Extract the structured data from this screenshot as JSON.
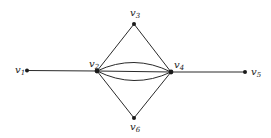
{
  "graph": {
    "vertices": [
      {
        "id": "v1",
        "name": "v",
        "sub": "1"
      },
      {
        "id": "v2",
        "name": "v",
        "sub": "2"
      },
      {
        "id": "v3",
        "name": "v",
        "sub": "3"
      },
      {
        "id": "v4",
        "name": "v",
        "sub": "4"
      },
      {
        "id": "v5",
        "name": "v",
        "sub": "5"
      },
      {
        "id": "v6",
        "name": "v",
        "sub": "6"
      }
    ],
    "edges": [
      {
        "from": "v1",
        "to": "v2",
        "kind": "straight"
      },
      {
        "from": "v2",
        "to": "v3",
        "kind": "straight"
      },
      {
        "from": "v3",
        "to": "v4",
        "kind": "straight"
      },
      {
        "from": "v2",
        "to": "v6",
        "kind": "straight"
      },
      {
        "from": "v6",
        "to": "v4",
        "kind": "straight"
      },
      {
        "from": "v4",
        "to": "v5",
        "kind": "straight"
      },
      {
        "from": "v2",
        "to": "v4",
        "kind": "straight"
      },
      {
        "from": "v2",
        "to": "v4",
        "kind": "curve-up"
      },
      {
        "from": "v2",
        "to": "v4",
        "kind": "curve-down"
      }
    ]
  }
}
